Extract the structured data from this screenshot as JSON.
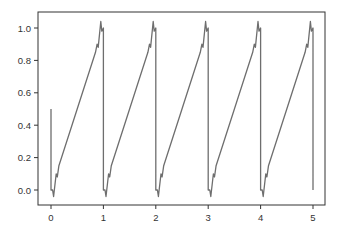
{
  "chart_data": {
    "type": "line",
    "title": "",
    "xlabel": "",
    "ylabel": "",
    "xlim": [
      -0.25,
      5.25
    ],
    "ylim": [
      -0.1,
      1.08
    ],
    "grid": false,
    "legend": null,
    "x_ticks": [
      "0",
      "1",
      "2",
      "3",
      "4",
      "5"
    ],
    "y_ticks": [
      "0.0",
      "0.2",
      "0.4",
      "0.6",
      "0.8",
      "1.0"
    ],
    "series": [
      {
        "name": "sawtooth (Fourier approximation)",
        "color": "#6e6e6e",
        "description": "Sawtooth wave with period 1, rising linearly from ~0 to ~1 each period with Gibbs ripple near discontinuities, dropping sharply at integer x; starts at 0.5 at x=0 and ends at ~0 at x=5",
        "x": [
          0.0,
          0.0,
          0.03,
          0.05,
          0.1,
          0.12,
          0.15,
          0.5,
          0.85,
          0.88,
          0.9,
          0.95,
          0.97,
          1.0,
          1.0,
          1.03,
          1.05,
          1.1,
          1.12,
          1.15,
          1.5,
          1.85,
          1.88,
          1.9,
          1.95,
          1.97,
          2.0,
          2.0,
          2.03,
          2.05,
          2.1,
          2.12,
          2.15,
          2.5,
          2.85,
          2.88,
          2.9,
          2.95,
          2.97,
          3.0,
          3.0,
          3.03,
          3.05,
          3.1,
          3.12,
          3.15,
          3.5,
          3.85,
          3.88,
          3.9,
          3.95,
          3.97,
          4.0,
          4.0,
          4.03,
          4.05,
          4.1,
          4.12,
          4.15,
          4.5,
          4.85,
          4.88,
          4.9,
          4.95,
          4.97,
          5.0,
          5.0
        ],
        "y": [
          0.5,
          0.0,
          0.0,
          -0.04,
          0.1,
          0.08,
          0.15,
          0.5,
          0.85,
          0.9,
          0.88,
          1.04,
          0.98,
          1.0,
          0.0,
          0.0,
          -0.04,
          0.1,
          0.08,
          0.15,
          0.5,
          0.85,
          0.9,
          0.88,
          1.04,
          0.98,
          1.0,
          0.0,
          0.0,
          -0.04,
          0.1,
          0.08,
          0.15,
          0.5,
          0.85,
          0.9,
          0.88,
          1.04,
          0.98,
          1.0,
          0.0,
          0.0,
          -0.04,
          0.1,
          0.08,
          0.15,
          0.5,
          0.85,
          0.9,
          0.88,
          1.04,
          0.98,
          1.0,
          0.0,
          0.0,
          -0.04,
          0.1,
          0.08,
          0.15,
          0.5,
          0.85,
          0.9,
          0.88,
          1.04,
          0.98,
          1.0,
          0.0
        ]
      }
    ]
  },
  "style": {
    "axis_color": "#333333",
    "line_color": "#6e6e6e",
    "background": "#ffffff"
  }
}
